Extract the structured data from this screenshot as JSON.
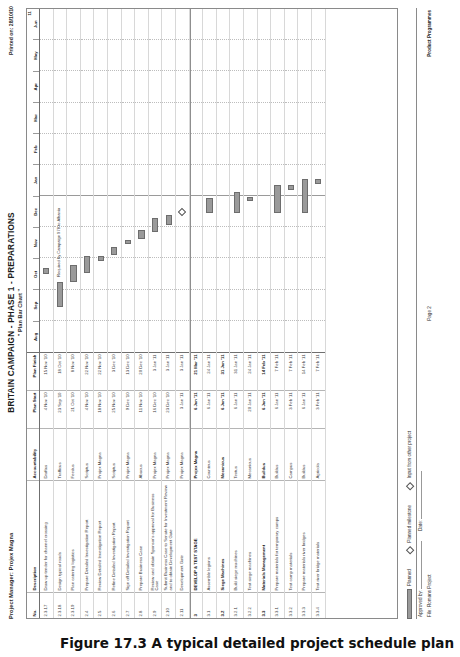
{
  "caption": "Figure 17.3  A typical detailed project schedule plan",
  "header": {
    "project_manager": "Project Manager: Projex Magna",
    "printed_on": "Printed on: 28/10/10",
    "title": "BRITAIN CAMPAIGN - PHASE 1 - PREPARATIONS",
    "subtitle": "\" Plan Bar Chart \""
  },
  "columns": {
    "no": "No.",
    "description": "Description",
    "accountability": "Accountability",
    "plan_start": "Plan Start",
    "plan_finish": "Plan Finish"
  },
  "timeline": {
    "months": [
      "Aug",
      "Sep",
      "Oct",
      "Nov",
      "Dec",
      "Jan",
      "Feb",
      "Mar",
      "Apr",
      "May",
      "Jun"
    ],
    "year_label": "11"
  },
  "rows": [
    {
      "no": "2.3.17",
      "desc": "Draw up tender for channel crossing",
      "acc": "Draftus",
      "start": "4 Nov '10",
      "finish": "15 Nov '10",
      "group": false,
      "bar": {
        "left": 22.8,
        "width": 1.6
      },
      "note": ""
    },
    {
      "no": "2.3.18",
      "desc": "Design typical roads",
      "acc": "Trafficus",
      "start": "23 Sep '10",
      "finish": "18 Oct '10",
      "group": false,
      "bar": {
        "left": 13.2,
        "width": 7.2
      },
      "note": "Required by Campaign 978 to Albania"
    },
    {
      "no": "2.3.19",
      "desc": "Plan catering logistics",
      "acc": "Feedus",
      "start": "21 Oct '10",
      "finish": "8 Nov '10",
      "group": false,
      "bar": {
        "left": 20.4,
        "width": 5.0
      },
      "note": ""
    },
    {
      "no": "2.4",
      "desc": "Prepare Detailed Investigation Report",
      "acc": "Scriptus",
      "start": "4 Nov '10",
      "finish": "22 Nov '10",
      "group": false,
      "bar": {
        "left": 22.9,
        "width": 5.0
      },
      "note": ""
    },
    {
      "no": "2.5",
      "desc": "Review Detailed Investigation Report",
      "acc": "Projex Magna",
      "start": "18 Nov '10",
      "finish": "22 Nov '10",
      "group": false,
      "bar": {
        "left": 26.6,
        "width": 1.3
      },
      "note": ""
    },
    {
      "no": "2.6",
      "desc": "Refine Detailed Investigation Report",
      "acc": "Scriptus",
      "start": "25 Nov '10",
      "finish": "3 Dec '10",
      "group": false,
      "bar": {
        "left": 28.3,
        "width": 2.2
      },
      "note": ""
    },
    {
      "no": "2.7",
      "desc": "Sign off Detailed Investigation Report",
      "acc": "Projex Magna",
      "start": "9 Dec '10",
      "finish": "13 Dec '10",
      "group": false,
      "bar": {
        "left": 31.6,
        "width": 1.1
      },
      "note": ""
    },
    {
      "no": "2.8",
      "desc": "Prepare Business Case",
      "acc": "Abacus",
      "start": "11 Nov '10",
      "finish": "20 Dec '10",
      "group": false,
      "bar": {
        "left": 33.0,
        "width": 2.6
      },
      "note": ""
    },
    {
      "no": "2.9",
      "desc": "Review and obtain Sponsor's approval for Business Case",
      "acc": "Projex Magna",
      "start": "16 Dec '10",
      "finish": "3 Jan '11",
      "group": false,
      "bar": {
        "left": 34.9,
        "width": 4.3
      },
      "note": ""
    },
    {
      "no": "2.10",
      "desc": "Submit Business Case to Senate for Investment Review and to obtain Development Gate",
      "acc": "Projex Magna",
      "start": "23 Dec '10",
      "finish": "3 Jan '11",
      "group": false,
      "bar": {
        "left": 37.0,
        "width": 2.9
      },
      "note": ""
    },
    {
      "no": "2.11",
      "desc": "Development Gate",
      "acc": "Projex Magna",
      "start": "3 Jan '11",
      "finish": "3 Jan '11",
      "group": false,
      "diamond": 39.8,
      "note": ""
    },
    {
      "no": "3",
      "desc": "DEVELOP & TEST STAGE",
      "acc": "Projex Magna",
      "start": "6 Jan '11",
      "finish": "21 Mar '11",
      "group": true,
      "bar": null,
      "note": ""
    },
    {
      "no": "3.1",
      "desc": "Assemble legions",
      "acc": "Counteus",
      "start": "6 Jan '11",
      "finish": "24 Jan '11",
      "group": false,
      "bar": {
        "left": 40.4,
        "width": 4.6
      },
      "note": ""
    },
    {
      "no": "3.2",
      "desc": "Siege Machines",
      "acc": "Mecanicus",
      "start": "6 Jan '11",
      "finish": "31 Jan '11",
      "group": true,
      "bar": null,
      "note": ""
    },
    {
      "no": "3.2.1",
      "desc": "Build siege machines",
      "acc": "Textus",
      "start": "6 Jan '11",
      "finish": "31 Jan '11",
      "group": false,
      "bar": {
        "left": 40.4,
        "width": 6.3
      },
      "note": ""
    },
    {
      "no": "3.2.2",
      "desc": "Test siege machines",
      "acc": "Mecanicus",
      "start": "20 Jan '11",
      "finish": "24 Jan '11",
      "group": false,
      "bar": {
        "left": 44.0,
        "width": 1.2
      },
      "note": ""
    },
    {
      "no": "3.3",
      "desc": "Materials Management",
      "acc": "Buildus",
      "start": "6 Jan '11",
      "finish": "14 Feb '11",
      "group": true,
      "bar": null,
      "note": ""
    },
    {
      "no": "3.3.1",
      "desc": "Prepare materials for temporary camps",
      "acc": "Buildus",
      "start": "6 Jan '11",
      "finish": "7 Feb '11",
      "group": false,
      "bar": {
        "left": 40.4,
        "width": 8.3
      },
      "note": ""
    },
    {
      "no": "3.3.2",
      "desc": "Test camp materials",
      "acc": "Campus",
      "start": "3 Feb '11",
      "finish": "7 Feb '11",
      "group": false,
      "bar": {
        "left": 47.3,
        "width": 1.3
      },
      "note": ""
    },
    {
      "no": "3.3.3",
      "desc": "Prepare materials river bridges",
      "acc": "Buildus",
      "start": "6 Jan '11",
      "finish": "14 Feb '11",
      "group": false,
      "bar": {
        "left": 40.4,
        "width": 10.1
      },
      "note": ""
    },
    {
      "no": "3.3.4",
      "desc": "Test river bridge materials",
      "acc": "Agricola",
      "start": "3 Feb '11",
      "finish": "7 Feb '11",
      "group": false,
      "bar": {
        "left": 49.0,
        "width": 1.4
      },
      "note": ""
    }
  ],
  "legend": {
    "planned_label": "Planned",
    "milestone_label": "Planned milestone",
    "input_label": "Input from other project"
  },
  "footer": {
    "approved_by": "Approved by:",
    "date": "Date:",
    "file": "File: Romans Project",
    "page": "Page 2",
    "product": "Product Programmes"
  }
}
